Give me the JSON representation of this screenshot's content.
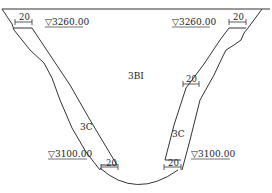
{
  "drawing": {
    "type": "cross-section",
    "line_color": "#333333",
    "background": "#ffffff",
    "elevations": {
      "top_left": "▽3260.00",
      "top_right": "▽3260.00",
      "bottom_left": "▽3100.00",
      "bottom_right": "▽3100.00"
    },
    "dimensions": {
      "top_left": "20",
      "top_right": "20",
      "mid_right": "20",
      "bottom_left": "20",
      "bottom_right": "20"
    },
    "zones": {
      "center": "3BⅠ",
      "left_lining": "3C",
      "right_lining": "3C"
    }
  }
}
